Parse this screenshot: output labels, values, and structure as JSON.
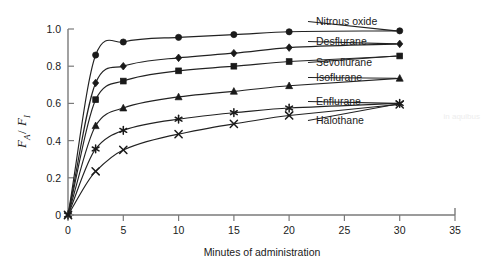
{
  "chart_data": {
    "type": "line",
    "title": "",
    "xlabel": "Minutes of administration",
    "ylabel": "FA/FI",
    "ylabel_parts": {
      "num_main": "F",
      "num_sub": "A",
      "slash": "/",
      "den_main": "F",
      "den_sub": "I"
    },
    "xlim": [
      0,
      35
    ],
    "ylim": [
      0,
      1.0
    ],
    "xticks": [
      0,
      5,
      10,
      15,
      20,
      25,
      30,
      35
    ],
    "xtick_labels": [
      "0",
      "5",
      "10",
      "15",
      "20",
      "25",
      "30",
      "35"
    ],
    "yticks": [
      0,
      0.2,
      0.4,
      0.6,
      0.8,
      1.0
    ],
    "ytick_labels": [
      "0",
      "0.2",
      "0.4",
      "0.6",
      "0.8",
      "1.0"
    ],
    "grid": false,
    "legend_position": "inline-right-labels",
    "x": [
      0,
      2.5,
      5,
      10,
      15,
      20,
      30
    ],
    "series": [
      {
        "name": "Nitrous oxide",
        "marker": "circle",
        "values": [
          0,
          0.86,
          0.93,
          0.955,
          0.97,
          0.985,
          0.99
        ]
      },
      {
        "name": "Desflurane",
        "marker": "diamond",
        "values": [
          0,
          0.71,
          0.8,
          0.845,
          0.87,
          0.9,
          0.92
        ]
      },
      {
        "name": "Sevoflurane",
        "marker": "square",
        "values": [
          0,
          0.62,
          0.72,
          0.775,
          0.8,
          0.825,
          0.855
        ]
      },
      {
        "name": "Isoflurane",
        "marker": "triangle",
        "values": [
          0,
          0.48,
          0.575,
          0.635,
          0.665,
          0.695,
          0.735
        ]
      },
      {
        "name": "Enflurane",
        "marker": "asterisk",
        "values": [
          0,
          0.355,
          0.455,
          0.515,
          0.55,
          0.575,
          0.6
        ]
      },
      {
        "name": "Halothane",
        "marker": "cross",
        "values": [
          0,
          0.235,
          0.35,
          0.435,
          0.49,
          0.535,
          0.595
        ]
      }
    ],
    "series_label_positions": [
      {
        "name": "Nitrous oxide",
        "x": 316,
        "y": 25
      },
      {
        "name": "Desflurane",
        "x": 316,
        "y": 45
      },
      {
        "name": "Sevoflurane",
        "x": 316,
        "y": 66
      },
      {
        "name": "Isoflurane",
        "x": 316,
        "y": 81
      },
      {
        "name": "Enflurane",
        "x": 316,
        "y": 105
      },
      {
        "name": "Halothane",
        "x": 316,
        "y": 124
      }
    ]
  },
  "watermark": {
    "fragment_right": "in aquibus",
    "fragment_mid": ""
  }
}
